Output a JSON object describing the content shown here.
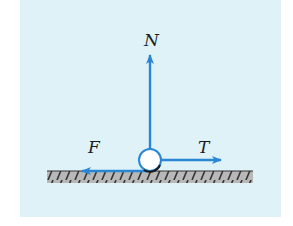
{
  "figure": {
    "type": "free-body-diagram",
    "panel_color": "#dff2f8",
    "arrow_color": "#2a86d3",
    "ground_fill": "#b5b5b5",
    "hatch_color": "#333333",
    "body": {
      "shape": "circle",
      "fill": "#ffffff",
      "outline": "#2a86d3"
    },
    "forces": [
      {
        "id": "normal",
        "label": "N",
        "direction": "up"
      },
      {
        "id": "tension",
        "label": "T",
        "direction": "right"
      },
      {
        "id": "friction",
        "label": "F",
        "direction": "left"
      }
    ]
  }
}
